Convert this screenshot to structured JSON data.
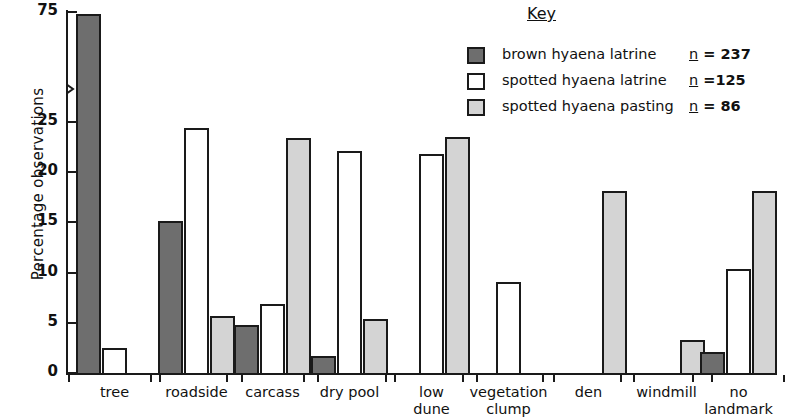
{
  "chart_data": {
    "type": "bar",
    "title": "",
    "xlabel": "",
    "ylabel": "Percentage observations",
    "ylim": [
      0,
      75
    ],
    "yticks": [
      0,
      5,
      10,
      15,
      20,
      25,
      75
    ],
    "ytick_labels": [
      "0",
      "5",
      "10",
      "15",
      "20",
      "25",
      "75"
    ],
    "axis_break": "y-axis broken between 25 and 75",
    "grid": false,
    "legend_position": "top-right",
    "categories": [
      "tree",
      "roadside",
      "carcass",
      "dry pool",
      "low dune",
      "vegetation clump",
      "den",
      "windmill",
      "no landmark"
    ],
    "category_lines": [
      [
        "tree"
      ],
      [
        "roadside"
      ],
      [
        "carcass"
      ],
      [
        "dry pool"
      ],
      [
        "low",
        "dune"
      ],
      [
        "vegetation",
        "clump"
      ],
      [
        "den"
      ],
      [
        "windmill"
      ],
      [
        "no",
        "landmark"
      ]
    ],
    "series": [
      {
        "name": "brown hyaena latrine",
        "n_label": "n = 237",
        "n": 237,
        "color": "#6e6e6e",
        "values": [
          75.0,
          15.3,
          5.0,
          1.9,
          0,
          0,
          0,
          0,
          2.3
        ]
      },
      {
        "name": "spotted hyaena latrine",
        "n_label": "n = 125",
        "n": 125,
        "color": "#ffffff",
        "values": [
          2.7,
          24.6,
          7.1,
          22.3,
          22.0,
          9.3,
          0,
          0,
          10.5
        ]
      },
      {
        "name": "spotted hyaena pasting",
        "n_label": "n = 86",
        "n": 86,
        "color": "#d4d4d4",
        "values": [
          0,
          5.9,
          23.6,
          5.6,
          23.7,
          0,
          18.3,
          3.5,
          18.3
        ]
      }
    ]
  },
  "legend": {
    "title": "Key",
    "entries": [
      {
        "label": "brown  hyaena  latrine",
        "n_prefix": "n",
        "n_value": "= 237",
        "swatch": "brown"
      },
      {
        "label": "spotted  hyaena  latrine",
        "n_prefix": "n",
        "n_value": "=125",
        "swatch": "white"
      },
      {
        "label": "spotted  hyaena  pasting",
        "n_prefix": "n",
        "n_value": "= 86",
        "swatch": "pasting"
      }
    ]
  }
}
